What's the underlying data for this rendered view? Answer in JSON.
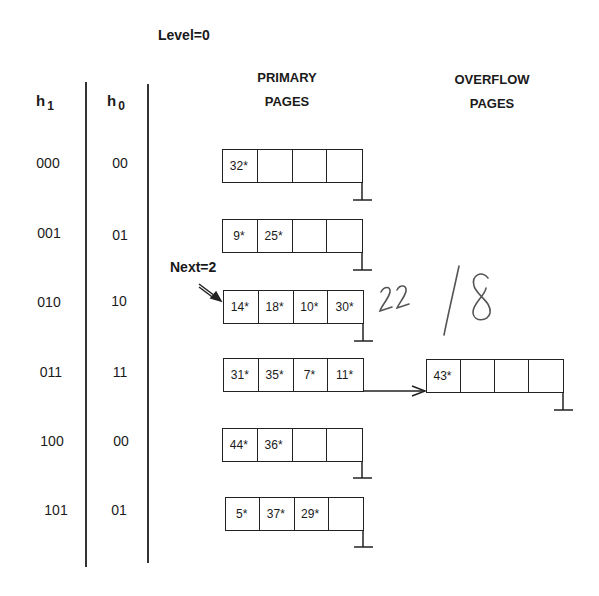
{
  "diagram": {
    "level_label": "Level=0",
    "next_label": "Next=2",
    "headers": {
      "h1": {
        "base": "h",
        "sub": "1"
      },
      "h0": {
        "base": "h",
        "sub": "0"
      },
      "primary": [
        "PRIMARY",
        "PAGES"
      ],
      "overflow": [
        "OVERFLOW",
        "PAGES"
      ]
    },
    "rows": [
      {
        "h1": "000",
        "h0": "00",
        "cells": [
          "32*",
          "",
          "",
          ""
        ],
        "overflow": null
      },
      {
        "h1": "001",
        "h0": "01",
        "cells": [
          "9*",
          "25*",
          "",
          ""
        ],
        "overflow": null
      },
      {
        "h1": "010",
        "h0": "10",
        "cells": [
          "14*",
          "18*",
          "10*",
          "30*"
        ],
        "overflow": null
      },
      {
        "h1": "011",
        "h0": "11",
        "cells": [
          "31*",
          "35*",
          "7*",
          "11*"
        ],
        "overflow": [
          "43*",
          "",
          "",
          ""
        ]
      },
      {
        "h1": "100",
        "h0": "00",
        "cells": [
          "44*",
          "36*",
          "",
          ""
        ],
        "overflow": null
      },
      {
        "h1": "101",
        "h0": "01",
        "cells": [
          "5*",
          "37*",
          "29*",
          ""
        ],
        "overflow": null
      }
    ],
    "handwritten": {
      "annotation_1": "22",
      "annotation_2_slash": "/",
      "annotation_2_digit": "8"
    },
    "colors": {
      "ink": "#222222",
      "pencil": "#555555",
      "background": "#ffffff"
    }
  }
}
